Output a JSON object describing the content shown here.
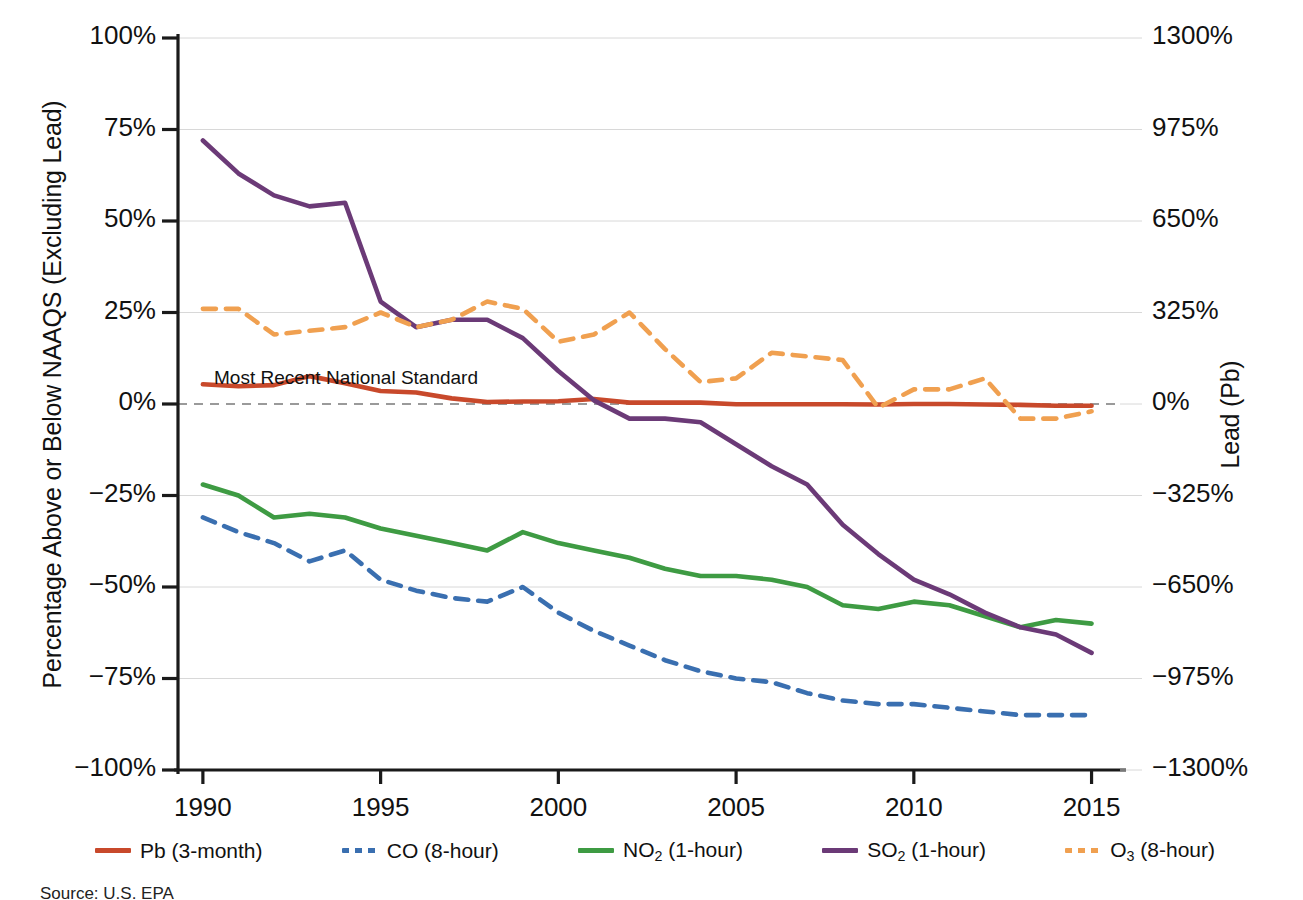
{
  "chart_data": {
    "type": "line",
    "title": "",
    "xlabel": "",
    "ylabel": "Percentage Above or Below NAAQS (Excluding Lead)",
    "ylabel_right": "Lead (Pb)",
    "x": [
      1990,
      1991,
      1992,
      1993,
      1994,
      1995,
      1996,
      1997,
      1998,
      1999,
      2000,
      2001,
      2002,
      2003,
      2004,
      2005,
      2006,
      2007,
      2008,
      2009,
      2010,
      2011,
      2012,
      2013,
      2014,
      2015
    ],
    "xtick_labels": [
      "1990",
      "1995",
      "2000",
      "2005",
      "2010",
      "2015"
    ],
    "xticks": [
      1990,
      1995,
      2000,
      2005,
      2010,
      2015
    ],
    "xlim": [
      1989.3,
      2015.8
    ],
    "ylim": [
      -100,
      100
    ],
    "yticks": [
      -100,
      -75,
      -50,
      -25,
      0,
      25,
      50,
      75,
      100
    ],
    "ytick_labels": [
      "−100%",
      "−75%",
      "−50%",
      "−25%",
      "0%",
      "25%",
      "50%",
      "75%",
      "100%"
    ],
    "ylim_right": [
      -1300,
      1300
    ],
    "yticks_right": [
      -1300,
      -975,
      -650,
      -325,
      0,
      325,
      650,
      975,
      1300
    ],
    "ytick_labels_right": [
      "−1300%",
      "−975%",
      "−650%",
      "−325%",
      "0%",
      "325%",
      "650%",
      "975%",
      "1300%"
    ],
    "grid": true,
    "legend_position": "below",
    "annotations": [
      {
        "text": "Most Recent National Standard",
        "x": 1990.2,
        "y": 3,
        "kind": "zero-reference-line-label"
      }
    ],
    "reference_line": {
      "y": 0,
      "style": "dashed",
      "color": "#9a9a9a"
    },
    "series": [
      {
        "name": "Pb (3-month)",
        "label": "Pb (3-month)",
        "color": "#C8492B",
        "style": "solid",
        "axis": "right",
        "values": [
          70,
          63,
          67,
          99,
          74,
          46,
          41,
          20,
          7,
          9,
          10,
          18,
          5,
          5,
          5,
          -1,
          -1,
          -1,
          -1,
          -2,
          0,
          0,
          -2,
          -3,
          -6,
          -6
        ]
      },
      {
        "name": "CO (8-hour)",
        "label": "CO (8-hour)",
        "color": "#3A6FB0",
        "style": "dashed",
        "axis": "left",
        "values": [
          -31,
          -35,
          -38,
          -43,
          -40,
          -48,
          -51,
          -53,
          -54,
          -50,
          -57,
          -62,
          -66,
          -70,
          -73,
          -75,
          -76,
          -79,
          -81,
          -82,
          -82,
          -83,
          -84,
          -85,
          -85,
          -85
        ]
      },
      {
        "name": "NO2 (1-hour)",
        "label": "NO₂ (1-hour)",
        "color": "#3E9B43",
        "style": "solid",
        "axis": "left",
        "values": [
          -22,
          -25,
          -31,
          -30,
          -31,
          -34,
          -36,
          -38,
          -40,
          -35,
          -38,
          -40,
          -42,
          -45,
          -47,
          -47,
          -48,
          -50,
          -55,
          -56,
          -54,
          -55,
          -58,
          -61,
          -59,
          -60
        ]
      },
      {
        "name": "SO2 (1-hour)",
        "label": "SO₂ (1-hour)",
        "color": "#6B3A77",
        "style": "solid",
        "axis": "left",
        "values": [
          72,
          63,
          57,
          54,
          55,
          28,
          21,
          23,
          23,
          18,
          9,
          1,
          -4,
          -4,
          -5,
          -11,
          -17,
          -22,
          -33,
          -41,
          -48,
          -52,
          -57,
          -61,
          -63,
          -68
        ]
      },
      {
        "name": "O3 (8-hour)",
        "label": "O₃ (8-hour)",
        "color": "#F0A050",
        "style": "dashed",
        "axis": "left",
        "values": [
          26,
          26,
          19,
          20,
          21,
          25,
          21,
          23,
          28,
          26,
          17,
          19,
          25,
          15,
          6,
          7,
          14,
          13,
          12,
          -1,
          4,
          4,
          7,
          -4,
          -4,
          -2
        ]
      }
    ]
  },
  "legend": {
    "items": [
      {
        "label": "Pb (3-month)",
        "color": "#C8492B",
        "style": "solid",
        "symbol_sub": "",
        "text_main": "Pb (3-month)"
      },
      {
        "label": "CO (8-hour)",
        "color": "#3A6FB0",
        "style": "dashed",
        "symbol_sub": "",
        "text_main": "CO (8-hour)"
      },
      {
        "label": "NO2 (1-hour)",
        "color": "#3E9B43",
        "style": "solid",
        "symbol_pre": "NO",
        "symbol_sub": "2",
        "symbol_post": " (1-hour)"
      },
      {
        "label": "SO2 (1-hour)",
        "color": "#6B3A77",
        "style": "solid",
        "symbol_pre": "SO",
        "symbol_sub": "2",
        "symbol_post": " (1-hour)"
      },
      {
        "label": "O3 (8-hour)",
        "color": "#F0A050",
        "style": "dashed",
        "symbol_pre": "O",
        "symbol_sub": "3",
        "symbol_post": " (8-hour)"
      }
    ]
  },
  "source_note": "Source: U.S. EPA",
  "colors": {
    "axis": "#1a1a1a",
    "grid": "#d8d8d8",
    "reference": "#9a9a9a",
    "background": "#ffffff"
  }
}
